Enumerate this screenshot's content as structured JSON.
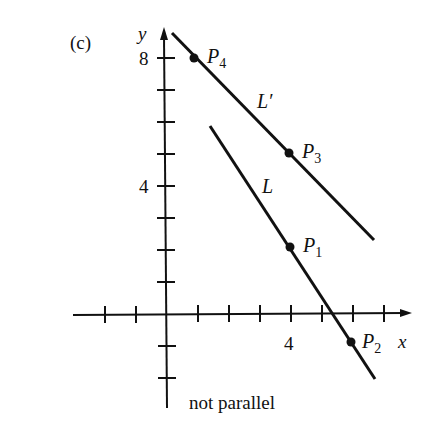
{
  "figure": {
    "panel_label": "(c)",
    "caption": "not parallel",
    "axes": {
      "x_label": "x",
      "y_label": "y",
      "x_tick_label": "4",
      "y_tick_labels": [
        "8",
        "4"
      ]
    },
    "lines": [
      {
        "name": "L",
        "label": "L",
        "points": [
          "P1",
          "P2"
        ]
      },
      {
        "name": "L'",
        "label": "L′",
        "points": [
          "P4",
          "P3"
        ]
      }
    ],
    "points": {
      "P1": {
        "base": "P",
        "sub": "1",
        "x": 4,
        "y": 2
      },
      "P2": {
        "base": "P",
        "sub": "2",
        "x": 6,
        "y": -1
      },
      "P3": {
        "base": "P",
        "sub": "3",
        "x": 4,
        "y": 5
      },
      "P4": {
        "base": "P",
        "sub": "4",
        "x": 1,
        "y": 8
      }
    },
    "color": "#111111"
  }
}
